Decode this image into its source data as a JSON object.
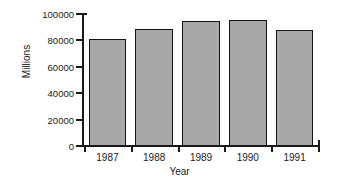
{
  "chart_data": {
    "type": "bar",
    "title": "",
    "subtitle": "",
    "categories": [
      "1987",
      "1988",
      "1989",
      "1990",
      "1991"
    ],
    "values": [
      81000,
      89000,
      94500,
      95500,
      88000
    ],
    "xlabel": "Year",
    "ylabel": "Millions",
    "ylim": [
      0,
      100000
    ],
    "yticks": [
      0,
      20000,
      40000,
      60000,
      80000,
      100000
    ],
    "ytick_labels": [
      "0",
      "20000",
      "40000",
      "60000",
      "80000",
      "100000"
    ],
    "grid": false,
    "legend": null,
    "series": [
      {
        "name": "Millions",
        "values": [
          81000,
          89000,
          94500,
          95500,
          88000
        ]
      }
    ],
    "bar_fill_color": "#a8a8a8",
    "bar_edge_color": "#141414",
    "axis_color": "#1a1a1a",
    "background_color": "#ffffff"
  }
}
